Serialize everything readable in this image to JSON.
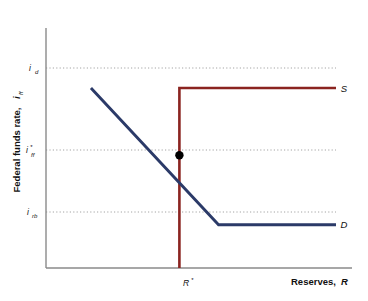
{
  "chart_data": {
    "type": "line",
    "title": "",
    "xlabel": "Reserves, R",
    "ylabel": "Federal funds rate, i",
    "ylabel_sub": "ff",
    "xlabel_main": "Reserves,",
    "xlabel_var": "R",
    "grid": "dotted-guides-only",
    "legend": "inline-curve-labels",
    "xlim": [
      0,
      1
    ],
    "ylim": [
      0,
      1
    ],
    "y_ticks": [
      {
        "id": "i_rb",
        "main": "i",
        "sub": "rb",
        "value": 0.18,
        "pixel_y": 212
      },
      {
        "id": "i_ff_star",
        "main": "i",
        "star": "*",
        "sub": "ff",
        "value": 0.47,
        "pixel_y": 150
      },
      {
        "id": "i_d",
        "main": "i",
        "sub": "d",
        "value": 0.75,
        "pixel_y": 68
      }
    ],
    "x_ticks": [
      {
        "id": "R_star",
        "main": "R",
        "star": "*",
        "value": 0.46,
        "pixel_x": 190
      }
    ],
    "series": [
      {
        "name": "S",
        "label": "S",
        "role": "supply",
        "color": "#8B2420",
        "description": "vertical at R* up to i_d, then horizontal right at i_d",
        "points": [
          {
            "x": 0.46,
            "y": 0.0
          },
          {
            "x": 0.46,
            "y": 0.75
          },
          {
            "x": 1.0,
            "y": 0.75
          }
        ]
      },
      {
        "name": "D",
        "label": "D",
        "role": "demand",
        "color": "#2B3A68",
        "description": "downward sloping from i_d, kinks flat at i_rb",
        "points": [
          {
            "x": 0.155,
            "y": 0.75
          },
          {
            "x": 0.595,
            "y": 0.18
          },
          {
            "x": 1.0,
            "y": 0.18
          }
        ]
      }
    ],
    "markers": [
      {
        "id": "equilibrium",
        "label": "",
        "x": 0.46,
        "y": 0.47,
        "color": "#000000",
        "shape": "circle"
      }
    ]
  },
  "axes": {
    "y_title_text": "Federal funds rate,",
    "y_title_var": "i",
    "y_title_sub": "ff",
    "x_title_text": "Reserves,",
    "x_title_var": "R"
  },
  "labels": {
    "supply": "S",
    "demand": "D",
    "i_d_main": "i",
    "i_d_sub": "d",
    "i_ff_main": "i",
    "i_ff_star": "*",
    "i_ff_sub": "ff",
    "i_rb_main": "i",
    "i_rb_sub": "rb",
    "r_star_main": "R",
    "r_star_star": "*"
  },
  "colors": {
    "supply": "#8B2420",
    "demand": "#2B3A68",
    "axis": "#8a8a8a",
    "guide": "#9a9a9a",
    "marker": "#000000",
    "background": "#ffffff"
  }
}
